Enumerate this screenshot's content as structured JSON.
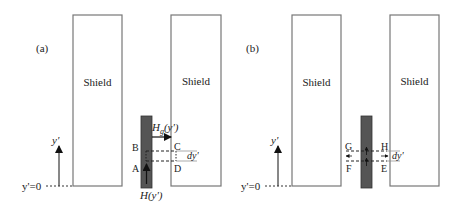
{
  "panels": [
    {
      "id": "a",
      "label": "(a)",
      "shield_left": {
        "label": "Shield"
      },
      "shield_right": {
        "label": "Shield"
      },
      "axis": {
        "label": "y'",
        "origin_label": "y'=0"
      },
      "field_labels": {
        "hg": "H",
        "hg_sub": "g",
        "hg_arg": "(y')",
        "h": "H(y')"
      },
      "points": {
        "A": "A",
        "B": "B",
        "C": "C",
        "D": "D"
      },
      "dy_label": "dy'"
    },
    {
      "id": "b",
      "label": "(b)",
      "shield_left": {
        "label": "Shield"
      },
      "shield_right": {
        "label": "Shield"
      },
      "axis": {
        "label": "y'",
        "origin_label": "y'=0"
      },
      "points": {
        "E": "E",
        "F": "F",
        "G": "G",
        "H": "H"
      },
      "dy_label": "dy'"
    }
  ],
  "colors": {
    "shield_stroke": "#777777",
    "bar_fill": "#555555",
    "line": "#222222"
  }
}
